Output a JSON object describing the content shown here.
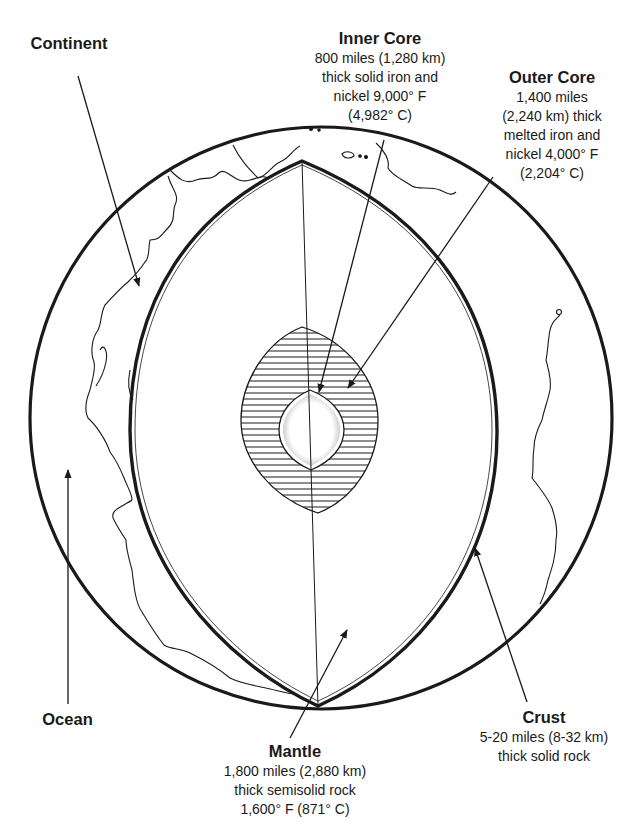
{
  "diagram": {
    "type": "earth-cross-section",
    "colors": {
      "ink": "#1a1a1a",
      "background": "#ffffff"
    },
    "labels": {
      "continent": {
        "title": "Continent"
      },
      "ocean": {
        "title": "Ocean"
      },
      "inner_core": {
        "title": "Inner Core",
        "lines": [
          "800 miles (1,280 km)",
          "thick solid iron and",
          "nickel 9,000° F",
          "(4,982° C)"
        ]
      },
      "outer_core": {
        "title": "Outer Core",
        "lines": [
          "1,400 miles",
          "(2,240 km) thick",
          "melted iron and",
          "nickel 4,000° F",
          "(2,204° C)"
        ]
      },
      "mantle": {
        "title": "Mantle",
        "lines": [
          "1,800 miles (2,880 km)",
          "thick semisolid rock",
          "1,600° F (871° C)"
        ]
      },
      "crust": {
        "title": "Crust",
        "lines": [
          "5-20 miles (8-32 km)",
          "thick solid rock"
        ]
      }
    }
  }
}
